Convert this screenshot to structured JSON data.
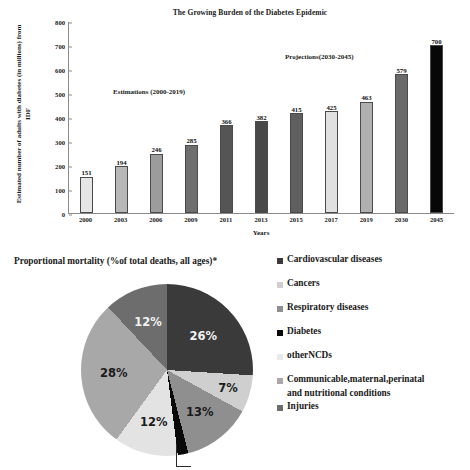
{
  "chart_data": [
    {
      "type": "bar",
      "title": "The Growing Burden of the Diabetes Epidemic",
      "xlabel": "Years",
      "ylabel": "Estimated number of adults with diabetes (in millions) from IDF",
      "categories": [
        "2000",
        "2003",
        "2006",
        "2009",
        "2011",
        "2013",
        "2015",
        "2017",
        "2019",
        "2030",
        "2045"
      ],
      "values": [
        151,
        194,
        246,
        285,
        366,
        382,
        415,
        425,
        463,
        579,
        700
      ],
      "bar_colors": [
        "#e6e6e6",
        "#b8b8b8",
        "#9c9c9c",
        "#6f6f6f",
        "#555555",
        "#484848",
        "#5f5f5f",
        "#e0e0e0",
        "#b0b0b0",
        "#6a6a6a",
        "#070707"
      ],
      "ylim": [
        0,
        800
      ],
      "yticks": [
        "0",
        "100",
        "200",
        "300",
        "400",
        "500",
        "600",
        "700",
        "800"
      ],
      "grid": false,
      "legend": "none",
      "annotations": [
        {
          "text": "Estimations (2000-2019)"
        },
        {
          "text": "Projections(2030-2045)"
        }
      ]
    },
    {
      "type": "pie",
      "title": "Proportional mortality (%of  total deaths, all ages)*",
      "labels": [
        "Cardiovascular diseases",
        "Cancers",
        "Respiratory diseases",
        "Diabetes",
        "otherNCDs",
        "Communicable,maternal,perinatal and nutritional conditions",
        "Injuries"
      ],
      "values": [
        26,
        7,
        13,
        2,
        12,
        28,
        12
      ],
      "value_labels": [
        "26%",
        "7%",
        "13%",
        "2%",
        "12%",
        "28%",
        "12%"
      ],
      "slice_colors": [
        "#3a3a3a",
        "#cfcfcf",
        "#8f8f8f",
        "#090909",
        "#e3e3e3",
        "#a8a8a8",
        "#6d6d6d"
      ],
      "legend": "right",
      "legend_entries": [
        {
          "label": "Cardiovascular diseases",
          "color": "#3a3a3a"
        },
        {
          "label": "Cancers",
          "color": "#cfcfcf"
        },
        {
          "label": "Respiratory diseases",
          "color": "#8f8f8f"
        },
        {
          "label": "Diabetes",
          "color": "#090909"
        },
        {
          "label": "otherNCDs",
          "color": "#e9e9e9"
        },
        {
          "label": "Communicable,maternal,perinatal",
          "color": "#a8a8a8"
        },
        {
          "label": "and nutritional conditions",
          "color": ""
        },
        {
          "label": "Injuries",
          "color": "#6d6d6d"
        }
      ]
    }
  ],
  "bar_chart": {
    "title": "The Growing Burden of the Diabetes Epidemic",
    "y_axis_title": "Estimated number of adults with diabetes (in millions) from IDF",
    "x_axis_title": "Years",
    "annotation_estimations": "Estimations (2000-2019)",
    "annotation_projections": "Projections(2030-2045)"
  },
  "pie_chart": {
    "title": "Proportional mortality (%of  total deaths, all ages)*",
    "label_diabetes": "2%"
  }
}
